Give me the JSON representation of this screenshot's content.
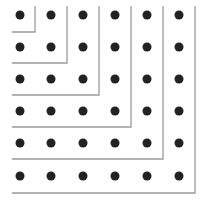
{
  "diagram": {
    "title": "",
    "grid_size": 6,
    "dot_color": "#222222",
    "line_color": "#9a9a9a",
    "background": "#ffffff",
    "dot_centers_x": [
      20,
      51,
      83,
      115,
      147,
      179
    ],
    "dot_centers_y": [
      15,
      47,
      79,
      111,
      143,
      176
    ],
    "dot_radius": 4.5,
    "line_start_x": 12,
    "line_top_y": 6,
    "gnomon_corners": [
      {
        "x": 35,
        "y": 32
      },
      {
        "x": 67,
        "y": 63
      },
      {
        "x": 99,
        "y": 95
      },
      {
        "x": 131,
        "y": 127
      },
      {
        "x": 163,
        "y": 159
      },
      {
        "x": 195,
        "y": 193
      }
    ]
  }
}
